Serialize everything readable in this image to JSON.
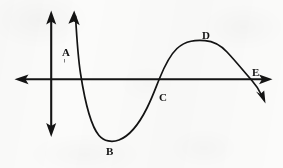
{
  "figure": {
    "background_color": "#fbfbfa",
    "ink_color": "#131313",
    "width": 283,
    "height": 168
  },
  "axes": {
    "x_axis": {
      "name": "horizontal-axis",
      "y": 79,
      "x_start": 15,
      "x_end": 272,
      "arrow_left": true,
      "arrow_right": true
    },
    "y_axis": {
      "name": "vertical-axis",
      "x": 51,
      "y_start": 11,
      "y_end": 137,
      "arrow_up": true,
      "arrow_down": true
    },
    "origin": {
      "x": 51,
      "y": 79
    }
  },
  "curve": {
    "name": "wave-curve",
    "stroke_width": 1.7,
    "arrow_start": "up",
    "arrow_end": "down",
    "start_point": {
      "x": 74,
      "y": 11
    },
    "end_point": {
      "x": 265,
      "y": 103
    },
    "path": "M 75.5 16 C 76.6 35 78.0 58 80.6 74 C 84.5 99 90.0 125 99.0 135.5 C 104.0 141.4 112.0 142.6 119.0 140.0 C 129.0 136.2 139.0 124.0 147.0 108.0 C 152.5 97.0 156.0 87.0 159.5 78.5 C 165.0 65.0 170.0 55.0 177.0 48.5 C 186.0 40.2 196.0 40.0 205.0 40.6 C 213.5 41.2 220.5 45.0 227.0 52.0 C 236.0 61.6 244.0 71.5 251.5 80.0 C 256.5 85.6 259.5 90.5 262.0 96.0"
  },
  "labels": [
    {
      "id": "A",
      "text": "A",
      "x": 62,
      "y": 47,
      "tick_below": true
    },
    {
      "id": "B",
      "text": "B",
      "x": 106,
      "y": 146
    },
    {
      "id": "C",
      "text": "C",
      "x": 159,
      "y": 92
    },
    {
      "id": "D",
      "text": "D",
      "x": 202,
      "y": 30
    },
    {
      "id": "E",
      "text": "E",
      "x": 252,
      "y": 67
    }
  ]
}
